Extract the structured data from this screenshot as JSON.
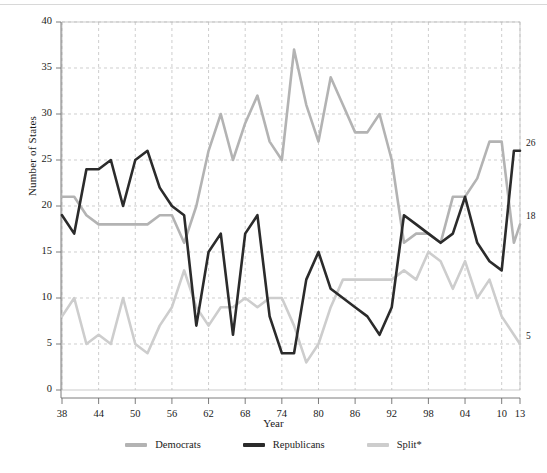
{
  "chart_data": {
    "type": "line",
    "title": "",
    "xlabel": "Year",
    "ylabel": "Number of States",
    "ylim": [
      0,
      40
    ],
    "ytick_values": [
      0,
      5,
      10,
      15,
      20,
      25,
      30,
      35,
      40
    ],
    "ytick_labels": [
      "0",
      "5",
      "10",
      "15",
      "20",
      "25",
      "30",
      "35",
      "40"
    ],
    "xtick_labels": [
      "38",
      "44",
      "50",
      "56",
      "62",
      "68",
      "74",
      "80",
      "86",
      "92",
      "98",
      "04",
      "10",
      "13"
    ],
    "xtick_years": [
      1938,
      1944,
      1950,
      1956,
      1962,
      1968,
      1974,
      1980,
      1986,
      1992,
      1998,
      2004,
      2010,
      2013
    ],
    "x": [
      1938,
      1940,
      1942,
      1944,
      1946,
      1948,
      1950,
      1952,
      1954,
      1956,
      1958,
      1960,
      1962,
      1964,
      1966,
      1968,
      1970,
      1972,
      1974,
      1976,
      1978,
      1980,
      1982,
      1984,
      1986,
      1988,
      1990,
      1992,
      1994,
      1996,
      1998,
      2000,
      2002,
      2004,
      2006,
      2008,
      2010,
      2012,
      2013
    ],
    "grid": true,
    "legend_position": "bottom",
    "series": [
      {
        "name": "Democrats",
        "color": "#b3b3b3",
        "end_label": "18",
        "values": [
          21,
          21,
          19,
          18,
          18,
          18,
          18,
          18,
          19,
          19,
          16,
          20,
          26,
          30,
          25,
          29,
          32,
          27,
          25,
          37,
          31,
          27,
          34,
          31,
          28,
          28,
          30,
          25,
          16,
          17,
          17,
          16,
          21,
          21,
          23,
          27,
          27,
          16,
          18
        ]
      },
      {
        "name": "Republicans",
        "color": "#2b2b2b",
        "end_label": "26",
        "values": [
          19,
          17,
          24,
          24,
          25,
          20,
          25,
          26,
          22,
          20,
          19,
          7,
          15,
          17,
          6,
          17,
          19,
          8,
          4,
          4,
          12,
          15,
          11,
          10,
          9,
          8,
          6,
          9,
          19,
          18,
          17,
          16,
          17,
          21,
          16,
          14,
          13,
          26,
          26
        ]
      },
      {
        "name": "Split*",
        "color": "#cdcdcd",
        "end_label": "5",
        "values": [
          8,
          10,
          5,
          6,
          5,
          10,
          5,
          4,
          7,
          9,
          13,
          9,
          7,
          9,
          9,
          10,
          9,
          10,
          10,
          7,
          3,
          5,
          9,
          12,
          12,
          12,
          12,
          12,
          13,
          12,
          15,
          14,
          11,
          14,
          10,
          12,
          8,
          6,
          5
        ]
      }
    ]
  },
  "axes": {
    "ylabel": "Number of States",
    "xlabel": "Year"
  },
  "legend": {
    "items": [
      {
        "label": "Democrats",
        "color": "#b3b3b3"
      },
      {
        "label": "Republicans",
        "color": "#2b2b2b"
      },
      {
        "label": "Split*",
        "color": "#cdcdcd"
      }
    ]
  },
  "end_labels": [
    {
      "name": "republicans-end-value",
      "text": "26"
    },
    {
      "name": "democrats-end-value",
      "text": "18"
    },
    {
      "name": "split-end-value",
      "text": "5"
    }
  ]
}
